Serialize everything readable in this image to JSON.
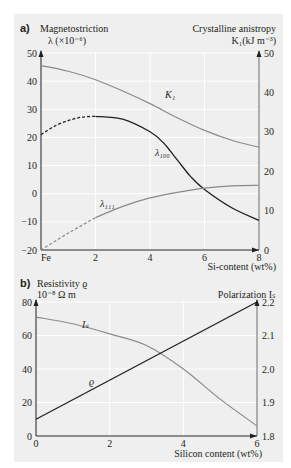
{
  "chart_data": [
    {
      "panel": "a)",
      "type": "line",
      "title": "",
      "ylabel_left": "Magnetostriction",
      "ylabel_left_unit": "λ (×10⁻⁶)",
      "ylabel_right": "Crystalline anistropy",
      "ylabel_right_unit": "K₁(kJ m⁻³)",
      "xlabel": "Si-content (wt%)",
      "xlim": [
        0,
        8
      ],
      "ylim_left": [
        -20,
        50
      ],
      "ylim_right": [
        -20,
        50
      ],
      "x_ticks": [
        "Fe",
        "2",
        "4",
        "6",
        "8"
      ],
      "y_ticks_left": [
        "50",
        "40",
        "30",
        "20",
        "10",
        "0",
        "-10",
        "-20"
      ],
      "y_ticks_right": [
        "50",
        "40",
        "30",
        "20",
        "10",
        "0"
      ],
      "grid": true,
      "series": [
        {
          "name": "K₁",
          "axis": "right",
          "color": "#8a8a8a",
          "x": [
            0,
            1,
            2,
            3,
            4,
            5,
            6,
            7,
            8
          ],
          "values": [
            45.5,
            43.5,
            40.5,
            36.5,
            32,
            27,
            22.5,
            19,
            16.5
          ]
        },
        {
          "name": "λ100",
          "axis": "left",
          "color": "#231f20",
          "dashed_until_x": 2,
          "x": [
            0,
            0.5,
            1,
            1.5,
            2,
            3,
            4,
            4.5,
            5,
            5.5,
            6,
            7,
            8
          ],
          "values": [
            21,
            24,
            26,
            27.2,
            27.5,
            26.5,
            22,
            18,
            12,
            6,
            1.5,
            -5,
            -9.5
          ]
        },
        {
          "name": "λ111",
          "axis": "left",
          "color": "#8a8a8a",
          "dashed_until_x": 2,
          "x": [
            0,
            1,
            2,
            3,
            4,
            5,
            6,
            7,
            8
          ],
          "values": [
            -20,
            -14,
            -8.5,
            -4.5,
            -1.5,
            0.5,
            2,
            2.8,
            3
          ]
        }
      ]
    },
    {
      "panel": "b)",
      "type": "line",
      "ylabel_left": "Resistivity ϱ",
      "ylabel_left_unit": "10⁻⁸ Ω m",
      "ylabel_right": "Polarization Iₛ",
      "xlabel": "Silicon content (wt%)",
      "xlim": [
        0,
        6
      ],
      "ylim_left": [
        0,
        80
      ],
      "ylim_right": [
        1.8,
        2.2
      ],
      "x_ticks": [
        "0",
        "2",
        "4",
        "6"
      ],
      "y_ticks_left": [
        "80",
        "60",
        "40",
        "20",
        "0"
      ],
      "y_ticks_right": [
        "2.2",
        "2.1",
        "2.0",
        "1.9",
        "1.8"
      ],
      "grid": true,
      "series": [
        {
          "name": "Iₛ",
          "axis": "right",
          "color": "#8a8a8a",
          "x": [
            0,
            1,
            2,
            3,
            4,
            5,
            6
          ],
          "values": [
            2.155,
            2.135,
            2.105,
            2.07,
            2.0,
            1.91,
            1.83
          ]
        },
        {
          "name": "ϱ",
          "axis": "left",
          "color": "#231f20",
          "x": [
            0,
            6
          ],
          "values": [
            10,
            80
          ]
        }
      ]
    }
  ],
  "labels": {
    "panel_a": "a)",
    "a_left_title": "Magnetostriction",
    "a_left_unit": "λ (×10⁻⁶)",
    "a_right_title": "Crystalline anistropy",
    "a_right_unit": "K₁(kJ m⁻³)",
    "a_xlabel": "Si-content (wt%)",
    "a_k1": "K₁",
    "a_l100": "λ₁₀₀",
    "a_l111": "λ₁₁₁",
    "panel_b": "b)",
    "b_left_title": "Resistivity ϱ",
    "b_left_unit": "10⁻⁸ Ω m",
    "b_right_title": "Polarization Iₛ",
    "b_xlabel": "Silicon content (wt%)",
    "b_is": "Iₛ",
    "b_rho": "ϱ"
  }
}
